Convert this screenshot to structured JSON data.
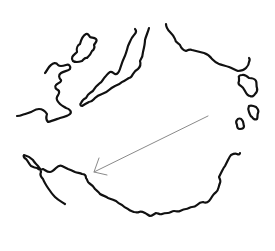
{
  "diagram": {
    "type": "hand-drawn sketch",
    "background": "#ffffff",
    "stroke_color": "#111111",
    "arrow_color": "#8a8a8a",
    "elements": [
      {
        "id": "island-left-small",
        "kind": "closed-outline"
      },
      {
        "id": "coast-left-wavy",
        "kind": "open-line"
      },
      {
        "id": "peninsula-center",
        "kind": "open-outline"
      },
      {
        "id": "coast-upper-right",
        "kind": "open-line"
      },
      {
        "id": "island-right-large",
        "kind": "closed-outline"
      },
      {
        "id": "island-right-medium",
        "kind": "closed-outline"
      },
      {
        "id": "island-right-small",
        "kind": "closed-outline"
      },
      {
        "id": "coast-bottom-arc",
        "kind": "open-line"
      },
      {
        "id": "arrow",
        "kind": "arrow",
        "from": [
          208,
          116
        ],
        "to": [
          94,
          172
        ],
        "direction": "down-left"
      }
    ]
  }
}
